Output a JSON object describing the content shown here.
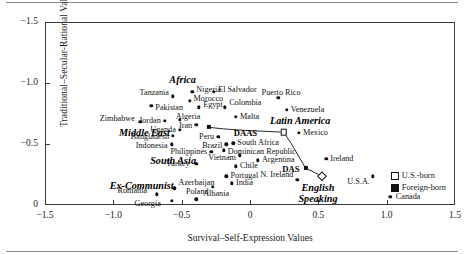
{
  "chart_data": {
    "type": "scatter",
    "title": "",
    "xlabel": "Survival–Self-Expression Values",
    "ylabel": "Traditional–Secular-Rational Values",
    "xlim": [
      -1.5,
      1.5
    ],
    "ylim": [
      -1.5,
      0.0
    ],
    "xticks": [
      "-1.5",
      "-1.0",
      "-0.5",
      "0",
      "0.5",
      "1.0",
      "1.5"
    ],
    "xtick_values": [
      -1.5,
      -1.0,
      -0.5,
      0,
      0.5,
      1.0,
      1.5
    ],
    "yticks": [
      "0",
      "-0.5",
      "-1.0",
      "-1.5"
    ],
    "ytick_values": [
      0,
      -0.5,
      -1.0,
      -1.5
    ],
    "grid": false,
    "legend_position": "bottom-right",
    "legend": [
      {
        "label": "U.S.-born",
        "marker": "open-square"
      },
      {
        "label": "Foreign-born",
        "marker": "filled-square"
      }
    ],
    "points": [
      {
        "label": "Georgia",
        "x": -0.58,
        "y": -0.045,
        "lx": -0.66,
        "ly": -0.015,
        "anchor": "l"
      },
      {
        "label": "Albania",
        "x": -0.4,
        "y": -0.055,
        "lx": -0.35,
        "ly": -0.095,
        "anchor": "r"
      },
      {
        "label": "Romania",
        "x": -0.69,
        "y": -0.095,
        "lx": -0.76,
        "ly": -0.125,
        "anchor": "l"
      },
      {
        "label": "Azerbaijan",
        "x": -0.56,
        "y": -0.145,
        "lx": -0.53,
        "ly": -0.185,
        "anchor": "r"
      },
      {
        "label": "Poland",
        "x": -0.28,
        "y": -0.155,
        "lx": -0.31,
        "ly": -0.115,
        "anchor": "l"
      },
      {
        "label": "India",
        "x": -0.14,
        "y": -0.185,
        "lx": -0.11,
        "ly": -0.185,
        "anchor": "r"
      },
      {
        "label": "Portugal",
        "x": -0.18,
        "y": -0.245,
        "lx": -0.15,
        "ly": -0.245,
        "anchor": "r"
      },
      {
        "label": "N. Ireland",
        "x": 0.34,
        "y": -0.215,
        "lx": 0.31,
        "ly": -0.258,
        "anchor": "l"
      },
      {
        "label": "Canada",
        "x": 1.02,
        "y": -0.075,
        "lx": 1.06,
        "ly": -0.075,
        "anchor": "r"
      },
      {
        "label": "U.S.A.",
        "x": 0.89,
        "y": -0.245,
        "lx": 0.87,
        "ly": -0.195,
        "anchor": "l"
      },
      {
        "label": "Turkey",
        "x": -0.4,
        "y": -0.345,
        "lx": -0.45,
        "ly": -0.345,
        "anchor": "l"
      },
      {
        "label": "Chile",
        "x": -0.11,
        "y": -0.325,
        "lx": -0.08,
        "ly": -0.325,
        "anchor": "r"
      },
      {
        "label": "Argentina",
        "x": 0.05,
        "y": -0.375,
        "lx": 0.08,
        "ly": -0.375,
        "anchor": "r"
      },
      {
        "label": "Vietnam",
        "x": -0.08,
        "y": -0.415,
        "lx": -0.11,
        "ly": -0.395,
        "anchor": "l"
      },
      {
        "label": "Ireland",
        "x": 0.55,
        "y": -0.385,
        "lx": 0.58,
        "ly": -0.385,
        "anchor": "r"
      },
      {
        "label": "Philippines",
        "x": -0.29,
        "y": -0.445,
        "lx": -0.32,
        "ly": -0.445,
        "anchor": "l"
      },
      {
        "label": "Dominican Republic",
        "x": -0.2,
        "y": -0.455,
        "lx": -0.17,
        "ly": -0.445,
        "anchor": "r"
      },
      {
        "label": "Indonesia",
        "x": -0.58,
        "y": -0.505,
        "lx": -0.61,
        "ly": -0.495,
        "anchor": "l"
      },
      {
        "label": "Brazil",
        "x": -0.18,
        "y": -0.505,
        "lx": -0.21,
        "ly": -0.495,
        "anchor": "l"
      },
      {
        "label": "South Africa",
        "x": -0.13,
        "y": -0.515,
        "lx": -0.1,
        "ly": -0.515,
        "anchor": "r"
      },
      {
        "label": "Bangladesh",
        "x": -0.57,
        "y": -0.575,
        "lx": -0.6,
        "ly": -0.565,
        "anchor": "l"
      },
      {
        "label": "Peru",
        "x": -0.24,
        "y": -0.565,
        "lx": -0.27,
        "ly": -0.565,
        "anchor": "l"
      },
      {
        "label": "Mexico",
        "x": 0.35,
        "y": -0.6,
        "lx": 0.38,
        "ly": -0.6,
        "anchor": "r"
      },
      {
        "label": "Uganda",
        "x": -0.52,
        "y": -0.625,
        "lx": -0.55,
        "ly": -0.625,
        "anchor": "l"
      },
      {
        "label": "Iran",
        "x": -0.4,
        "y": -0.665,
        "lx": -0.43,
        "ly": -0.655,
        "anchor": "l"
      },
      {
        "label": "Jordan",
        "x": -0.63,
        "y": -0.7,
        "lx": -0.66,
        "ly": -0.695,
        "anchor": "l"
      },
      {
        "label": "Algeria",
        "x": -0.52,
        "y": -0.705,
        "lx": -0.55,
        "ly": -0.73,
        "anchor": "r"
      },
      {
        "label": "Zimbabwe",
        "x": -0.81,
        "y": -0.69,
        "lx": -0.85,
        "ly": -0.71,
        "anchor": "l"
      },
      {
        "label": "Malta",
        "x": -0.11,
        "y": -0.73,
        "lx": -0.08,
        "ly": -0.73,
        "anchor": "r"
      },
      {
        "label": "Venezuela",
        "x": 0.26,
        "y": -0.79,
        "lx": 0.29,
        "ly": -0.79,
        "anchor": "r"
      },
      {
        "label": "Pakistan",
        "x": -0.73,
        "y": -0.82,
        "lx": -0.7,
        "ly": -0.8,
        "anchor": "r"
      },
      {
        "label": "Egypt",
        "x": -0.38,
        "y": -0.81,
        "lx": -0.35,
        "ly": -0.83,
        "anchor": "r"
      },
      {
        "label": "Colombia",
        "x": -0.19,
        "y": -0.81,
        "lx": -0.16,
        "ly": -0.845,
        "anchor": "r"
      },
      {
        "label": "Morocco",
        "x": -0.45,
        "y": -0.86,
        "lx": -0.42,
        "ly": -0.88,
        "anchor": "r"
      },
      {
        "label": "Tanzania",
        "x": -0.57,
        "y": -0.9,
        "lx": -0.6,
        "ly": -0.925,
        "anchor": "l"
      },
      {
        "label": "Nigeria",
        "x": -0.43,
        "y": -0.935,
        "lx": -0.4,
        "ly": -0.95,
        "anchor": "r"
      },
      {
        "label": "El Salvador",
        "x": -0.27,
        "y": -0.935,
        "lx": -0.24,
        "ly": -0.95,
        "anchor": "r"
      },
      {
        "label": "Puerto Rico",
        "x": 0.2,
        "y": -0.885,
        "lx": 0.22,
        "ly": -0.925,
        "anchor": "c"
      }
    ],
    "regions": [
      {
        "label": "Ex-Communist",
        "x": -0.8,
        "y": -0.165
      },
      {
        "label": "South Asia",
        "x": -0.57,
        "y": -0.37
      },
      {
        "label": "Middle East",
        "x": -0.78,
        "y": -0.6
      },
      {
        "label": "Africa",
        "x": -0.5,
        "y": -1.035
      },
      {
        "label": "English\nSpeaking",
        "x": 0.49,
        "y": -0.095
      },
      {
        "label": "Latin America",
        "x": 0.36,
        "y": -0.7
      }
    ],
    "survey_groups": [
      {
        "name": "DAS",
        "label_x": 0.355,
        "label_y": -0.3,
        "foreign_born": {
          "x": 0.4,
          "y": -0.31
        },
        "us_born": {
          "x": 0.52,
          "y": -0.245
        }
      },
      {
        "name": "DAAS",
        "label_x": 0.045,
        "label_y": -0.6,
        "foreign_born": {
          "x": -0.31,
          "y": -0.645
        },
        "us_born": {
          "x": 0.24,
          "y": -0.605
        },
        "path": [
          {
            "x": -0.31,
            "y": -0.645
          },
          {
            "x": -0.2,
            "y": -0.632
          },
          {
            "x": -0.05,
            "y": -0.62
          },
          {
            "x": 0.24,
            "y": -0.605
          },
          {
            "x": 0.29,
            "y": -0.52
          },
          {
            "x": 0.4,
            "y": -0.31
          }
        ]
      }
    ]
  }
}
